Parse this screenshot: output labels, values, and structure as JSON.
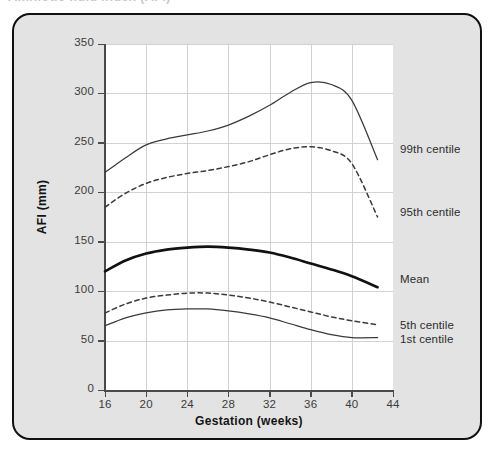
{
  "caption": {
    "text": "Amniotic fluid index (AFI)"
  },
  "chart_data": {
    "type": "line",
    "title": "",
    "xlabel": "Gestation (weeks)",
    "ylabel": "AFI (mm)",
    "xlim": [
      16,
      44
    ],
    "ylim": [
      0,
      350
    ],
    "xticks": [
      16,
      20,
      24,
      28,
      32,
      36,
      40,
      44
    ],
    "yticks": [
      0,
      50,
      100,
      150,
      200,
      250,
      300,
      350
    ],
    "grid": true,
    "legend_position": "right-of-axes-inline",
    "x": [
      16,
      18,
      20,
      22,
      24,
      26,
      28,
      30,
      32,
      34,
      36,
      38,
      40,
      42.5
    ],
    "series": [
      {
        "name": "99th centile",
        "label": "99th centile",
        "style": "solid-thin",
        "color": "#3a3a3a",
        "label_y_value": 242,
        "values": [
          220,
          235,
          248,
          254,
          258,
          262,
          268,
          277,
          288,
          301,
          311,
          309,
          293,
          233
        ]
      },
      {
        "name": "95th centile",
        "label": "95th centile",
        "style": "dashed",
        "color": "#3a3a3a",
        "label_y_value": 178,
        "values": [
          185,
          199,
          209,
          215,
          219,
          222,
          226,
          231,
          238,
          244,
          246,
          242,
          229,
          175
        ]
      },
      {
        "name": "Mean",
        "label": "Mean",
        "style": "solid-thick",
        "color": "#111111",
        "label_y_value": 110,
        "values": [
          120,
          131,
          138,
          142,
          144,
          145,
          144,
          142,
          139,
          134,
          128,
          122,
          115,
          104
        ]
      },
      {
        "name": "5th centile",
        "label": "5th centile",
        "style": "dashed",
        "color": "#3a3a3a",
        "label_y_value": 64,
        "values": [
          78,
          87,
          93,
          96,
          98,
          98,
          96,
          93,
          89,
          84,
          79,
          74,
          70,
          66
        ]
      },
      {
        "name": "1st centile",
        "label": "1st centile",
        "style": "solid-thin",
        "color": "#3a3a3a",
        "label_y_value": 50,
        "values": [
          65,
          73,
          78,
          81,
          82,
          82,
          80,
          77,
          73,
          67,
          61,
          56,
          53,
          53
        ]
      }
    ]
  }
}
